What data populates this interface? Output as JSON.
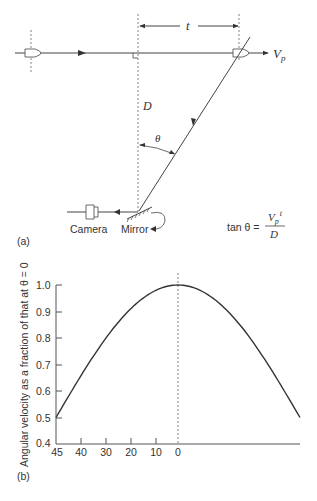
{
  "panel_a": {
    "label": "(a)",
    "distance_label": "D",
    "time_label": "t",
    "velocity_label": "V",
    "velocity_subscript": "p",
    "angle_label": "θ",
    "camera_label": "Camera",
    "mirror_label": "Mirror",
    "formula": {
      "lhs": "tan θ =",
      "numerator_main": "V",
      "numerator_sub": "p",
      "numerator_sup": "t",
      "denominator": "D"
    }
  },
  "panel_b": {
    "label": "(b)"
  },
  "chart_data": {
    "type": "line",
    "title": "",
    "xlabel": "",
    "ylabel": "Angular velocity as a fraction of that at θ = 0",
    "x_tick_labels": [
      "45",
      "40",
      "30",
      "20",
      "10",
      "0"
    ],
    "y_tick_labels": [
      "1.0",
      "0.9",
      "0.8",
      "0.7",
      "0.6",
      "0.5",
      "0.4"
    ],
    "ylim": [
      0.4,
      1.0
    ],
    "xlim": [
      -45,
      45
    ],
    "grid": false,
    "legend": null,
    "annotations": [
      "dashed vertical line at θ = 0"
    ],
    "series": [
      {
        "name": "cos²θ",
        "x": [
          -45,
          -40,
          -30,
          -20,
          -10,
          0,
          10,
          20,
          30,
          40,
          45
        ],
        "values": [
          0.5,
          0.587,
          0.75,
          0.883,
          0.97,
          1.0,
          0.97,
          0.883,
          0.75,
          0.587,
          0.5
        ]
      }
    ]
  }
}
